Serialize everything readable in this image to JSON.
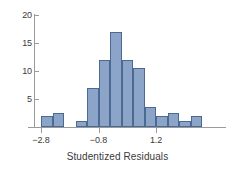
{
  "chart_data": {
    "type": "bar",
    "title": "",
    "xlabel": "Studentized Residuals",
    "ylabel": "",
    "xlim": [
      -3.35,
      3.0
    ],
    "ylim": [
      0,
      20
    ],
    "grid": false,
    "legend": null,
    "bin_width": 0.4,
    "x_ticks": [
      {
        "value": -2.8,
        "label": "−2.8"
      },
      {
        "value": -0.8,
        "label": "−0.8"
      },
      {
        "value": 1.2,
        "label": "1.2"
      }
    ],
    "y_ticks": [
      {
        "value": 5,
        "label": "5"
      },
      {
        "value": 10,
        "label": "10"
      },
      {
        "value": 15,
        "label": "15"
      },
      {
        "value": 20,
        "label": "20"
      }
    ],
    "bars": [
      {
        "bin_start": -3.0,
        "bin_end": -2.6,
        "value": 2
      },
      {
        "bin_start": -2.6,
        "bin_end": -2.2,
        "value": 2.5
      },
      {
        "bin_start": -1.8,
        "bin_end": -1.4,
        "value": 1
      },
      {
        "bin_start": -1.4,
        "bin_end": -1.0,
        "value": 7
      },
      {
        "bin_start": -1.0,
        "bin_end": -0.6,
        "value": 12
      },
      {
        "bin_start": -0.6,
        "bin_end": -0.2,
        "value": 17
      },
      {
        "bin_start": -0.2,
        "bin_end": 0.2,
        "value": 12
      },
      {
        "bin_start": 0.2,
        "bin_end": 0.6,
        "value": 10.5
      },
      {
        "bin_start": 0.6,
        "bin_end": 1.0,
        "value": 3.5
      },
      {
        "bin_start": 1.0,
        "bin_end": 1.4,
        "value": 2
      },
      {
        "bin_start": 1.4,
        "bin_end": 1.8,
        "value": 2.5
      },
      {
        "bin_start": 1.8,
        "bin_end": 2.2,
        "value": 1
      },
      {
        "bin_start": 2.2,
        "bin_end": 2.6,
        "value": 2
      }
    ],
    "colors": {
      "bar_fill": "#8ba4c8",
      "bar_stroke": "#4a6a94",
      "axis": "#9a9a9a",
      "text": "#3a3a3a",
      "background": "#ffffff"
    }
  }
}
